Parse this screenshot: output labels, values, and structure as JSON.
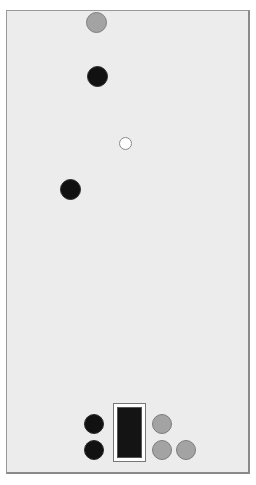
{
  "game": {
    "board": {
      "background": "#ececec"
    },
    "pieces": [
      {
        "id": "gray-top",
        "color": "gray"
      },
      {
        "id": "black-1",
        "color": "black"
      },
      {
        "id": "white-ball",
        "color": "white"
      },
      {
        "id": "black-2",
        "color": "black"
      },
      {
        "id": "black-tray-1",
        "color": "black"
      },
      {
        "id": "black-tray-2",
        "color": "black"
      },
      {
        "id": "gray-tray-1",
        "color": "gray"
      },
      {
        "id": "gray-tray-2",
        "color": "gray"
      },
      {
        "id": "gray-tray-3",
        "color": "gray"
      }
    ],
    "colors": {
      "black": "#111111",
      "gray": "#a3a3a3",
      "white": "#ffffff"
    }
  }
}
